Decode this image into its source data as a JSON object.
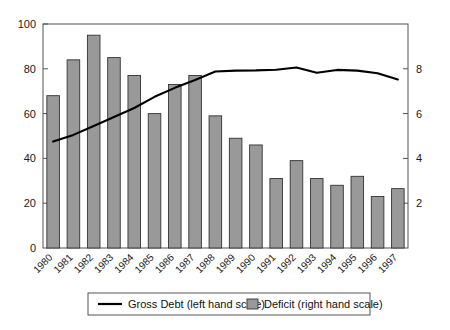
{
  "chart_data": {
    "type": "bar",
    "title": "",
    "subtitle": "",
    "xlabel": "",
    "ylabel": "",
    "grid": false,
    "legend_position": "bottom",
    "categories": [
      "1980",
      "1981",
      "1982",
      "1983",
      "1984",
      "1985",
      "1986",
      "1987",
      "1988",
      "1989",
      "1990",
      "1991",
      "1992",
      "1993",
      "1994",
      "1995",
      "1996",
      "1997"
    ],
    "left_axis": {
      "label": "",
      "ticks": [
        "0",
        "20",
        "40",
        "60",
        "80",
        "100"
      ],
      "tick_values": [
        0,
        20,
        40,
        60,
        80,
        100
      ],
      "ylim": [
        0,
        100
      ],
      "series": "Gross Debt (left hand scale)"
    },
    "right_axis": {
      "label": "",
      "ticks": [
        "2",
        "4",
        "6",
        "8"
      ],
      "tick_values": [
        2,
        4,
        6,
        8
      ],
      "ylim": [
        0,
        10
      ],
      "series": "Deficit (right hand scale)"
    },
    "series": [
      {
        "name": "Deficit (right hand scale)",
        "type": "bar",
        "axis": "right",
        "color": "#999999",
        "edge_color": "#333333",
        "values": [
          6.8,
          8.4,
          9.5,
          8.5,
          7.7,
          6.0,
          7.3,
          7.7,
          5.9,
          4.9,
          4.6,
          3.1,
          3.9,
          3.1,
          2.8,
          3.2,
          2.3,
          2.65
        ]
      },
      {
        "name": "Gross Debt (left hand scale)",
        "type": "line",
        "axis": "left",
        "color": "#000000",
        "values": [
          47.5,
          50.5,
          54.5,
          58.5,
          62.5,
          67.5,
          71.5,
          75.0,
          78.8,
          79.2,
          79.3,
          79.6,
          80.6,
          78.2,
          79.5,
          79.2,
          78.0,
          75.2
        ]
      }
    ]
  },
  "legend": {
    "items": [
      {
        "label": "Gross Debt (left hand scale)",
        "marker": "line",
        "color": "#000000"
      },
      {
        "label": "Deficit (right hand scale)",
        "marker": "swatch",
        "color": "#999999"
      }
    ]
  },
  "colors": {
    "bar_fill": "#999999",
    "bar_edge": "#333333",
    "line": "#000000",
    "axis": "#555555",
    "text": "#1a1a1a",
    "background": "#ffffff"
  }
}
